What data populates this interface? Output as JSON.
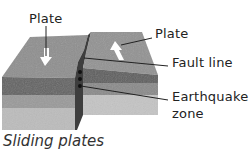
{
  "diagram": {
    "title": "Sliding plates",
    "labels": {
      "plate_left": "Plate",
      "plate_right": "Plate",
      "fault_line": "Fault line",
      "earthquake_zone_line1": "Earthquake",
      "earthquake_zone_line2": "zone"
    },
    "elements": [
      {
        "name": "left-plate",
        "motion": "arrow pointing toward viewer"
      },
      {
        "name": "right-plate",
        "motion": "arrow pointing away from viewer"
      },
      {
        "name": "fault-line"
      },
      {
        "name": "earthquake-zone",
        "dots": 3
      }
    ],
    "colors": {
      "top_surface": "#8c8c8c",
      "dark_band": "#5e5e5e",
      "mid_band": "#909090",
      "light_band": "#bdbdbd",
      "fault_face": "#3c3c3c",
      "arrow": "#ffffff",
      "leader": "#222222"
    }
  }
}
